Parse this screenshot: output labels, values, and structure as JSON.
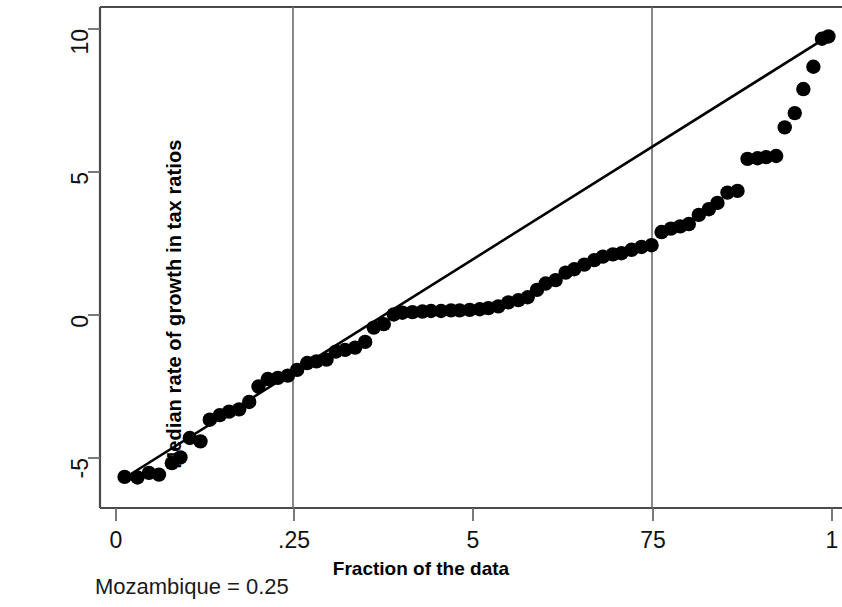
{
  "chart_data": {
    "type": "scatter",
    "title": "",
    "subtitle": "",
    "xlabel": "Fraction of the data",
    "ylabel": "Median rate of growth in tax ratios",
    "annotation": "Mozambique = 0.25",
    "grid": "vertical-at-quartiles",
    "legend": "none",
    "xlim": [
      0,
      1
    ],
    "ylim": [
      -6.2,
      10.3
    ],
    "xticks": [
      0,
      0.25,
      0.5,
      0.75,
      1
    ],
    "xticklabels": [
      "0",
      ".25",
      "5",
      "75",
      "1"
    ],
    "yticks": [
      -5,
      0,
      5,
      10
    ],
    "yticklabels": [
      "-5",
      "0",
      "5",
      "10"
    ],
    "gridlines_x": [
      0.25,
      0.75
    ],
    "reference_line": {
      "label": "fitted line",
      "x": [
        0.012,
        0.995
      ],
      "y": [
        -5.7,
        9.75
      ],
      "color": "#000000"
    },
    "series": [
      {
        "name": "Median rate of growth in tax ratios (quantiles)",
        "marker": "filled-circle",
        "color": "#000000",
        "points": [
          [
            0.012,
            -5.66
          ],
          [
            0.03,
            -5.68
          ],
          [
            0.046,
            -5.52
          ],
          [
            0.06,
            -5.58
          ],
          [
            0.078,
            -5.18
          ],
          [
            0.09,
            -4.98
          ],
          [
            0.103,
            -4.3
          ],
          [
            0.118,
            -4.42
          ],
          [
            0.131,
            -3.66
          ],
          [
            0.145,
            -3.5
          ],
          [
            0.158,
            -3.38
          ],
          [
            0.172,
            -3.3
          ],
          [
            0.186,
            -3.04
          ],
          [
            0.199,
            -2.5
          ],
          [
            0.212,
            -2.24
          ],
          [
            0.226,
            -2.2
          ],
          [
            0.24,
            -2.12
          ],
          [
            0.253,
            -1.92
          ],
          [
            0.267,
            -1.68
          ],
          [
            0.28,
            -1.62
          ],
          [
            0.294,
            -1.56
          ],
          [
            0.307,
            -1.28
          ],
          [
            0.32,
            -1.22
          ],
          [
            0.334,
            -1.14
          ],
          [
            0.348,
            -0.94
          ],
          [
            0.36,
            -0.44
          ],
          [
            0.374,
            -0.32
          ],
          [
            0.388,
            0.02
          ],
          [
            0.4,
            0.08
          ],
          [
            0.414,
            0.1
          ],
          [
            0.428,
            0.12
          ],
          [
            0.44,
            0.14
          ],
          [
            0.454,
            0.14
          ],
          [
            0.468,
            0.16
          ],
          [
            0.48,
            0.16
          ],
          [
            0.494,
            0.18
          ],
          [
            0.508,
            0.2
          ],
          [
            0.52,
            0.24
          ],
          [
            0.534,
            0.3
          ],
          [
            0.548,
            0.44
          ],
          [
            0.562,
            0.52
          ],
          [
            0.575,
            0.62
          ],
          [
            0.588,
            0.88
          ],
          [
            0.6,
            1.1
          ],
          [
            0.614,
            1.22
          ],
          [
            0.628,
            1.48
          ],
          [
            0.64,
            1.6
          ],
          [
            0.654,
            1.76
          ],
          [
            0.668,
            1.92
          ],
          [
            0.68,
            2.04
          ],
          [
            0.694,
            2.12
          ],
          [
            0.706,
            2.16
          ],
          [
            0.72,
            2.28
          ],
          [
            0.734,
            2.38
          ],
          [
            0.748,
            2.44
          ],
          [
            0.762,
            2.9
          ],
          [
            0.775,
            3.02
          ],
          [
            0.788,
            3.1
          ],
          [
            0.8,
            3.18
          ],
          [
            0.814,
            3.5
          ],
          [
            0.828,
            3.7
          ],
          [
            0.84,
            3.92
          ],
          [
            0.854,
            4.28
          ],
          [
            0.868,
            4.34
          ],
          [
            0.882,
            5.46
          ],
          [
            0.896,
            5.48
          ],
          [
            0.908,
            5.52
          ],
          [
            0.922,
            5.56
          ],
          [
            0.934,
            6.56
          ],
          [
            0.948,
            7.06
          ],
          [
            0.96,
            7.9
          ],
          [
            0.974,
            8.68
          ],
          [
            0.986,
            9.66
          ],
          [
            0.995,
            9.74
          ]
        ]
      }
    ]
  },
  "axis": {
    "x_tick_labels": [
      "0",
      ".25",
      "5",
      "75",
      "1"
    ],
    "y_tick_labels": [
      "10",
      "5",
      "0",
      "-5"
    ],
    "x_title": "Fraction of the data",
    "y_title": "Median rate of growth in tax ratios"
  },
  "footer": {
    "note": "Mozambique = 0.25"
  },
  "colors": {
    "marker": "#000000",
    "line": "#000000",
    "axis": "#4a4a4a",
    "grid": "#6b6b6b",
    "background": "#ffffff"
  }
}
